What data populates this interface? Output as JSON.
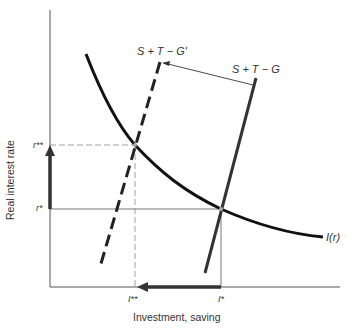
{
  "diagram": {
    "xlabel": "Investment, saving",
    "ylabel": "Real interest rate",
    "curves": {
      "investment": "I(r)",
      "saving_original": "S + T − G",
      "saving_shifted": "S + T − G'"
    },
    "y_ticks": {
      "r_star": "r*",
      "r_double_star": "r**"
    },
    "x_ticks": {
      "i_star": "I*",
      "i_double_star": "I**"
    },
    "colors": {
      "curve": "#111111",
      "axis": "#444444",
      "guide": "#888888",
      "text": "#333333"
    }
  }
}
